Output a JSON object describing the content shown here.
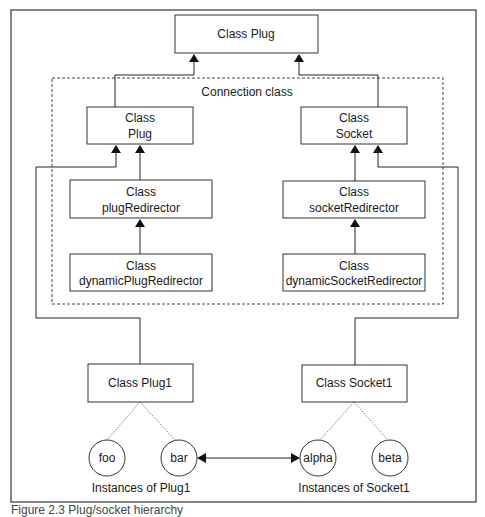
{
  "diagram": {
    "top_class": {
      "line1": "Class Plug"
    },
    "connection_group_label": "Connection class",
    "plug": {
      "line1": "Class",
      "line2": "Plug"
    },
    "socket": {
      "line1": "Class",
      "line2": "Socket"
    },
    "plug_redirector": {
      "line1": "Class",
      "line2": "plugRedirector"
    },
    "socket_redirector": {
      "line1": "Class",
      "line2": "socketRedirector"
    },
    "dynamic_plug_redirector": {
      "line1": "Class",
      "line2": "dynamicPlugRedirector"
    },
    "dynamic_socket_redirector": {
      "line1": "Class",
      "line2": "dynamicSocketRedirector"
    },
    "plug1": {
      "line1": "Class Plug1"
    },
    "socket1": {
      "line1": "Class Socket1"
    },
    "instances": {
      "foo": "foo",
      "bar": "bar",
      "alpha": "alpha",
      "beta": "beta"
    },
    "instances_plug1_label": "Instances of Plug1",
    "instances_socket1_label": "Instances of Socket1"
  },
  "caption": "Figure 2.3  Plug/socket hierarchy"
}
